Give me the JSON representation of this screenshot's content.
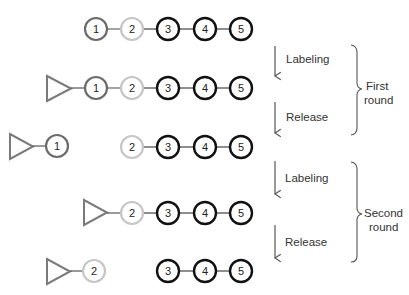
{
  "diagram": {
    "type": "sequential labeling and release of chain elements",
    "colors": {
      "element_1": "#6b6b6b",
      "element_2": "#c6c6c6",
      "element_3_to_5": "#111111",
      "label_tag": "#7a7a7a",
      "arrow": "#555555",
      "brace": "#555555",
      "connector": "#444444"
    },
    "elements": [
      "1",
      "2",
      "3",
      "4",
      "5"
    ],
    "rows": [
      {
        "id": "initial",
        "tag": false,
        "groups": [
          {
            "tag": false,
            "items": [
              "1",
              "2",
              "3",
              "4",
              "5"
            ]
          }
        ]
      },
      {
        "id": "first-labeled",
        "groups": [
          {
            "tag": true,
            "items": [
              "1",
              "2",
              "3",
              "4",
              "5"
            ]
          }
        ]
      },
      {
        "id": "first-released",
        "groups": [
          {
            "tag": true,
            "items": [
              "1"
            ]
          },
          {
            "tag": false,
            "items": [
              "2",
              "3",
              "4",
              "5"
            ]
          }
        ]
      },
      {
        "id": "second-labeled",
        "groups": [
          {
            "tag": true,
            "items": [
              "2",
              "3",
              "4",
              "5"
            ]
          }
        ]
      },
      {
        "id": "second-released",
        "groups": [
          {
            "tag": true,
            "items": [
              "2"
            ]
          },
          {
            "tag": false,
            "items": [
              "3",
              "4",
              "5"
            ]
          }
        ]
      }
    ],
    "steps": [
      {
        "label": "Labeling"
      },
      {
        "label": "Release"
      },
      {
        "label": "Labeling"
      },
      {
        "label": "Release"
      }
    ],
    "rounds": [
      {
        "line1": "First",
        "line2": "round"
      },
      {
        "line1": "Second",
        "line2": "round"
      }
    ]
  }
}
